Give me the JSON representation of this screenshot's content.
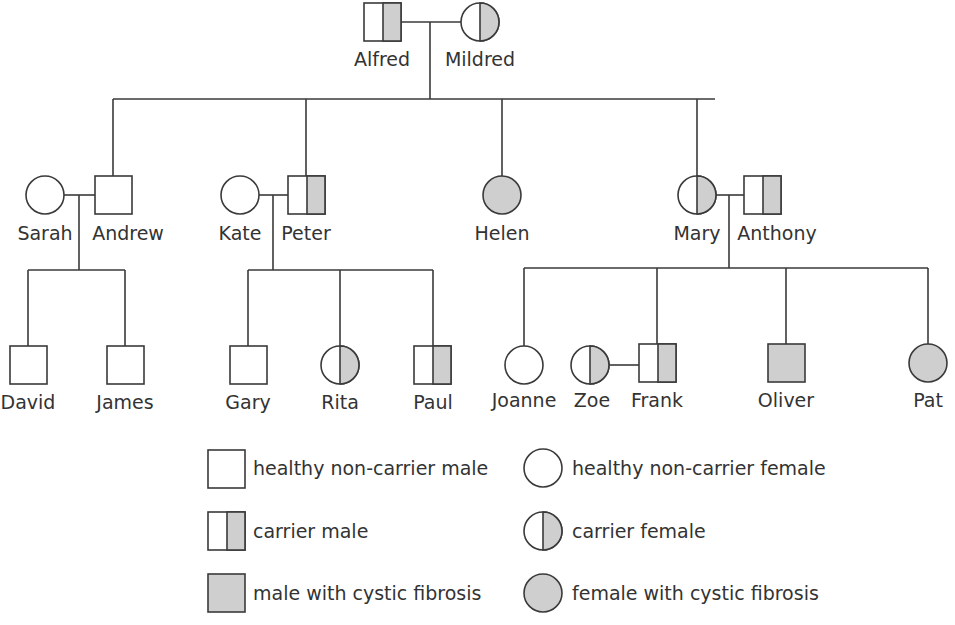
{
  "colors": {
    "stroke": "#3a3a3a",
    "affected_fill": "#cfcfcf",
    "unaffected_fill": "#ffffff",
    "text": "#333333"
  },
  "people": {
    "alfred": {
      "name": "Alfred",
      "sex": "male",
      "status": "carrier"
    },
    "mildred": {
      "name": "Mildred",
      "sex": "female",
      "status": "carrier"
    },
    "sarah": {
      "name": "Sarah",
      "sex": "female",
      "status": "healthy non-carrier"
    },
    "andrew": {
      "name": "Andrew",
      "sex": "male",
      "status": "healthy non-carrier"
    },
    "kate": {
      "name": "Kate",
      "sex": "female",
      "status": "healthy non-carrier"
    },
    "peter": {
      "name": "Peter",
      "sex": "male",
      "status": "carrier"
    },
    "helen": {
      "name": "Helen",
      "sex": "female",
      "status": "cystic fibrosis"
    },
    "mary": {
      "name": "Mary",
      "sex": "female",
      "status": "carrier"
    },
    "anthony": {
      "name": "Anthony",
      "sex": "male",
      "status": "carrier"
    },
    "david": {
      "name": "David",
      "sex": "male",
      "status": "healthy non-carrier"
    },
    "james": {
      "name": "James",
      "sex": "male",
      "status": "healthy non-carrier"
    },
    "gary": {
      "name": "Gary",
      "sex": "male",
      "status": "healthy non-carrier"
    },
    "rita": {
      "name": "Rita",
      "sex": "female",
      "status": "carrier"
    },
    "paul": {
      "name": "Paul",
      "sex": "male",
      "status": "carrier"
    },
    "joanne": {
      "name": "Joanne",
      "sex": "female",
      "status": "healthy non-carrier"
    },
    "zoe": {
      "name": "Zoe",
      "sex": "female",
      "status": "carrier"
    },
    "frank": {
      "name": "Frank",
      "sex": "male",
      "status": "carrier"
    },
    "oliver": {
      "name": "Oliver",
      "sex": "male",
      "status": "cystic fibrosis"
    },
    "pat": {
      "name": "Pat",
      "sex": "female",
      "status": "cystic fibrosis"
    }
  },
  "relationships": {
    "couples": [
      [
        "Alfred",
        "Mildred"
      ],
      [
        "Sarah",
        "Andrew"
      ],
      [
        "Kate",
        "Peter"
      ],
      [
        "Mary",
        "Anthony"
      ],
      [
        "Zoe",
        "Frank"
      ]
    ],
    "children": {
      "Alfred+Mildred": [
        "Andrew",
        "Peter",
        "Helen",
        "Mary"
      ],
      "Sarah+Andrew": [
        "David",
        "James"
      ],
      "Kate+Peter": [
        "Gary",
        "Rita",
        "Paul"
      ],
      "Mary+Anthony": [
        "Joanne",
        "Frank",
        "Oliver",
        "Pat"
      ]
    }
  },
  "legend": {
    "healthy_male": "healthy non-carrier male",
    "carrier_male": "carrier male",
    "affected_male": "male with cystic fibrosis",
    "healthy_female": "healthy non-carrier female",
    "carrier_female": "carrier female",
    "affected_female": "female with cystic fibrosis"
  }
}
